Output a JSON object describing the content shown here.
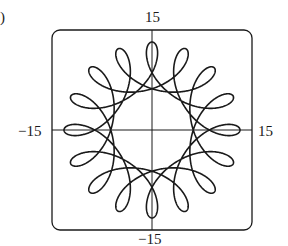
{
  "figure": {
    "panel_label": ")",
    "frame": {
      "left": 52,
      "top": 30,
      "right": 252,
      "bottom": 230,
      "corner_radius": 8
    },
    "axis_labels": {
      "y_max": "15",
      "y_min": "−15",
      "x_min": "−15",
      "x_max": "15"
    },
    "colors": {
      "stroke": "#1a1a1a",
      "background": "#ffffff"
    }
  },
  "chart_data": {
    "type": "line",
    "title": "",
    "xlim": [
      -15,
      15
    ],
    "ylim": [
      -15,
      15
    ],
    "x_ticks": [
      "-15",
      "15"
    ],
    "y_ticks": [
      "-15",
      "15"
    ],
    "grid": false,
    "axes_through_origin": true,
    "parametric": {
      "x": "R*cos(t) + r*cos(q*t)",
      "y": "R*sin(t) - r*sin(q*t)",
      "R": 9.6,
      "r": 3.6,
      "q": 4.333333,
      "t_range": [
        0,
        18.8496
      ],
      "loops": 10,
      "approx_outer_radius": 13.5,
      "approx_loop_tip_radius": 6.2
    }
  }
}
